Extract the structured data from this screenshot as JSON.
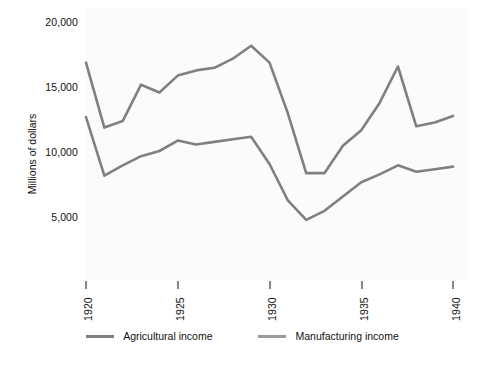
{
  "chart_data": {
    "type": "line",
    "title": "",
    "xlabel": "",
    "ylabel": "Millions of dollars",
    "xlim": [
      1919.4,
      1940.6
    ],
    "ylim": [
      0,
      21000
    ],
    "grid": false,
    "legend_position": "bottom-center",
    "xticks": [
      "1920",
      "1925",
      "1930",
      "1935",
      "1940"
    ],
    "xtick_values": [
      1920,
      1925,
      1930,
      1935,
      1940
    ],
    "yticks": [
      "5,000",
      "10,000",
      "15,000",
      "20,000"
    ],
    "ytick_values": [
      5000,
      10000,
      15000,
      20000
    ],
    "x": [
      1920,
      1921,
      1922,
      1923,
      1924,
      1925,
      1926,
      1927,
      1928,
      1929,
      1930,
      1931,
      1932,
      1933,
      1934,
      1935,
      1936,
      1937,
      1938,
      1939,
      1940
    ],
    "series": [
      {
        "name": "Agricultural income",
        "color": "#808080",
        "values": [
          12600,
          8100,
          8900,
          9600,
          10000,
          10800,
          10500,
          10700,
          10900,
          11100,
          9000,
          6200,
          4700,
          5400,
          6500,
          7600,
          8200,
          8900,
          8400,
          8600,
          8800
        ]
      },
      {
        "name": "Manufacturing income",
        "color": "#808080",
        "values": [
          16800,
          11800,
          12300,
          15100,
          14500,
          15800,
          16200,
          16400,
          17100,
          18100,
          16800,
          12900,
          8300,
          8300,
          10400,
          11600,
          13700,
          16500,
          11900,
          12200,
          12700
        ]
      }
    ],
    "legend": [
      {
        "label": "Agricultural income",
        "color": "#808080"
      },
      {
        "label": "Manufacturing income",
        "color": "#808080"
      }
    ],
    "colors": {
      "line": "#808080",
      "axis": "#111111",
      "panel_background": "#fbfbfa",
      "figure_background": "#ffffff"
    }
  }
}
